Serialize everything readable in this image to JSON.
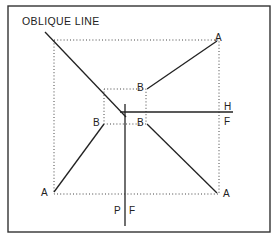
{
  "title": "OBLIQUE LINE",
  "labels": {
    "a_top_right": "A",
    "a_bottom_left": "A",
    "a_bottom_right": "A",
    "b_top_right": "B",
    "b_left": "B",
    "b_right": "B",
    "h": "H",
    "f_right": "F",
    "p": "P",
    "f_bottom": "F"
  },
  "colors": {
    "line": "#222222",
    "background": "#ffffff"
  }
}
